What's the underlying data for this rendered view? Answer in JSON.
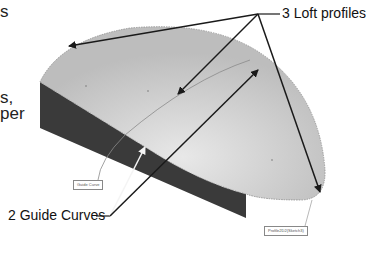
{
  "left_text_fragments": [
    {
      "text": "s",
      "top": 2
    },
    {
      "text": "s,",
      "top": 88
    },
    {
      "text": "per",
      "top": 104
    },
    {
      "text": "o",
      "top": 122
    }
  ],
  "callouts": {
    "loft_profiles": "3 Loft profiles",
    "guide_curves": "2 Guide Curves"
  },
  "tags": {
    "guide_curve": "Guide Curve",
    "profile": "Profile2D2(Sketch3)"
  },
  "colors": {
    "top_face": "#c4c4c4",
    "top_face_highlight": "#e2e2e2",
    "side_face": "#3a3a3a",
    "arrow": "#1a1a1a",
    "guide_arrow_light": "#f4f4f4"
  }
}
